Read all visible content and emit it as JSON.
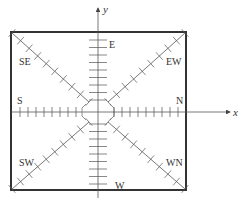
{
  "diagram": {
    "type": "coordinate-frame-with-directional-hatched-lines",
    "axes": {
      "x_label": "x",
      "y_label": "y"
    },
    "labels": {
      "E": "E",
      "W": "W",
      "S": "S",
      "N": "N",
      "SE": "SE",
      "EW": "EW",
      "SW": "SW",
      "WN": "WN"
    },
    "colors": {
      "stroke": "#444444",
      "box": "#333333",
      "text": "#333333"
    }
  }
}
